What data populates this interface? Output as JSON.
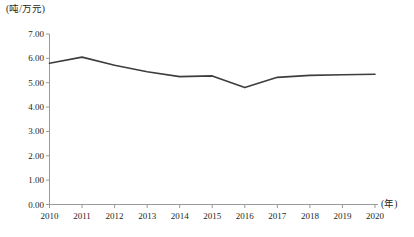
{
  "chart_data": {
    "type": "line",
    "title": "",
    "subtitle": "",
    "xlabel": "(年)",
    "ylabel": "(吨/万元)",
    "categories": [
      "2010",
      "2011",
      "2012",
      "2013",
      "2014",
      "2015",
      "2016",
      "2017",
      "2018",
      "2019",
      "2020"
    ],
    "series": [
      {
        "name": "",
        "values": [
          5.8,
          6.05,
          5.72,
          5.45,
          5.25,
          5.28,
          4.8,
          5.22,
          5.3,
          5.33,
          5.35
        ]
      }
    ],
    "ylim": [
      0.0,
      7.0
    ],
    "ytick_labels": [
      "0.00",
      "1.00",
      "2.00",
      "3.00",
      "4.00",
      "5.00",
      "6.00",
      "7.00"
    ],
    "ytick_values": [
      0,
      1,
      2,
      3,
      4,
      5,
      6,
      7
    ],
    "grid": false,
    "legend": "none",
    "line_color": "#3d3d3d",
    "axis_color": "#9a9a9a",
    "markers": false
  }
}
